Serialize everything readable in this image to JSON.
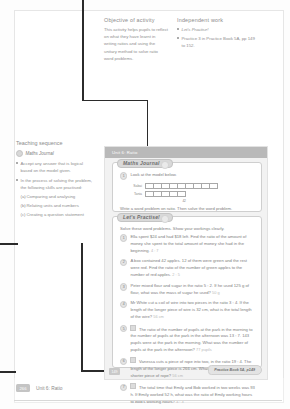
{
  "notes": {
    "objective": {
      "heading": "Objective of activity",
      "body": "This activity helps pupils to reflect on what they have learnt in writing ratios and using the unitary method to solve ratio word problems."
    },
    "independent": {
      "heading": "Independent work",
      "items": [
        "Let's Practise!",
        "Practice 3 in Practice Book 5A, pp 149 to 152."
      ]
    }
  },
  "teaching": {
    "heading": "Teaching sequence",
    "subheading": "Maths Journal",
    "bullets": [
      "Accept any answer that is logical based on the model given.",
      "In the process of solving the problem, the following skills are practised:"
    ],
    "skills": [
      {
        "label": "(a)",
        "text": "Comparing and analysing"
      },
      {
        "label": "(b)",
        "text": "Relating units and numbers"
      },
      {
        "label": "(c)",
        "text": "Creating a question statement"
      }
    ]
  },
  "book": {
    "header": "Unit 6: Ratio",
    "page_number": "149",
    "callout": "Practice Book 5A, p149",
    "maths_journal": {
      "title": "Maths Journal",
      "question_number": "1",
      "prompt": "Look at the model below.",
      "bars": [
        {
          "label": "Sabai",
          "cells": 9
        },
        {
          "label": "Tania",
          "cells": 5
        }
      ],
      "brace": "42",
      "footer": "Write a word problem on ratio. Then solve the word problem."
    },
    "lets_practise": {
      "title": "Let's Practise!",
      "intro": "Solve these word problems. Show your workings clearly.",
      "questions": [
        {
          "num": "1",
          "text": "Ella spent $24 and had $18 left. Find the ratio of the amount of money she spent to the total amount of money she had in the beginning.",
          "answer": "4 : 7"
        },
        {
          "num": "2",
          "text": "A box contained 42 apples. 12 of them were green and the rest were red. Find the ratio of the number of green apples to the number of red apples.",
          "answer": "2 : 5"
        },
        {
          "num": "3",
          "text": "Peter mixed flour and sugar in the ratio 5 : 2. If he used 125 g of flour, what was the mass of sugar he used?",
          "answer": "50 g"
        },
        {
          "num": "4",
          "text": "Mr White cut a coil of wire into two pieces in the ratio 3 : 4. If the length of the longer piece of wire is 32 cm, what is the total length of the wire?",
          "answer": "56 cm"
        },
        {
          "num": "5",
          "starred": true,
          "text": "The ratio of the number of pupils at the park in the morning to the number of pupils at the park in the afternoon was 13 : 7. 143 pupils were at the park in the morning. What was the number of pupils at the park in the afternoon?",
          "answer": "77 pupils"
        },
        {
          "num": "6",
          "starred": true,
          "text": "Vanessa cuts a piece of rope into two, in the ratio 19 : 4. The length of the longer piece is 266 cm. What is the length of the shorter piece of rope?",
          "answer": "56 cm"
        },
        {
          "num": "7",
          "starred": true,
          "text": "The total time that Emily and Bob worked in two weeks was 93 h. If Emily worked 52 h, what was the ratio of Emily working hours to Bob's working hours?",
          "answer": "4 : 3"
        }
      ]
    }
  },
  "footer": {
    "page": "266",
    "unit": "Unit 6: Ratio"
  }
}
